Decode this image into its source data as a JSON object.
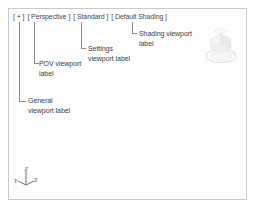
{
  "viewport": {
    "header_segments": [
      {
        "id": "general",
        "text": "[ + ]"
      },
      {
        "id": "pov",
        "text": "[ Perspective ]"
      },
      {
        "id": "settings",
        "text": "[ Standard ]"
      },
      {
        "id": "shading",
        "text": "[ Default Shading ]"
      }
    ],
    "header_full": "[ + ] [ Perspective ] [ Standard ] [ Default Shading ]",
    "background_color": "#fdfdfd",
    "border_color": "#c9c9c9"
  },
  "annotations": [
    {
      "id": "shading",
      "line1": "Shading viewport",
      "line2": "label"
    },
    {
      "id": "settings",
      "line1": "Settings",
      "line2": "viewport label"
    },
    {
      "id": "pov",
      "line1": "POV viewport",
      "line2": "label"
    },
    {
      "id": "general",
      "line1": "General",
      "line2": "viewport label"
    }
  ],
  "axis_tripod": {
    "labels": {
      "x": "X",
      "y": "Y",
      "z": "Z"
    },
    "color": "#6e6e6e"
  },
  "view_cube": {
    "label": "view-cube",
    "color": "#d8d8d8"
  },
  "leader_color": "#8d8d8d"
}
